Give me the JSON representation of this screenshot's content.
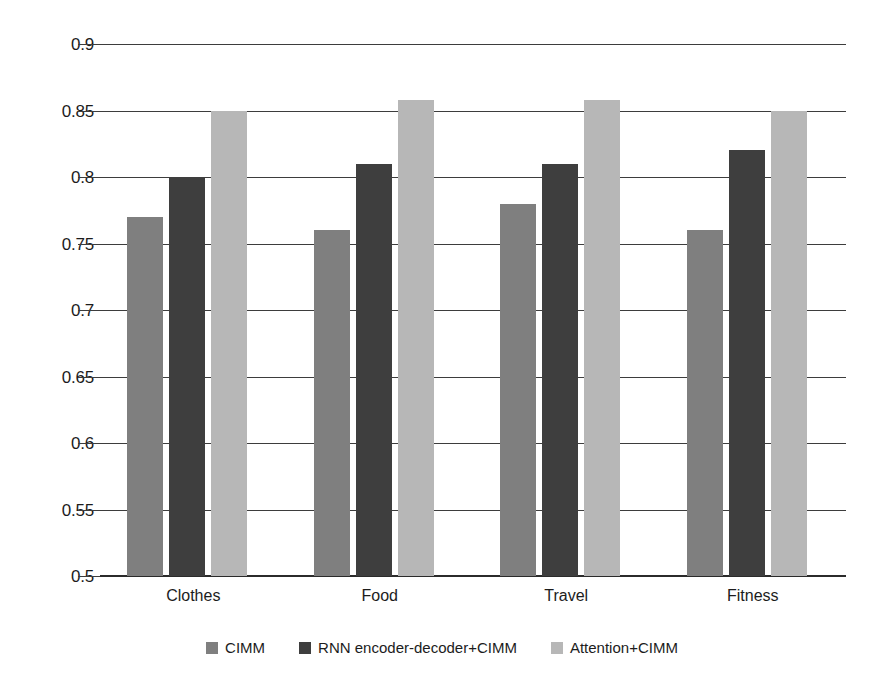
{
  "chart_data": {
    "type": "bar",
    "title": "",
    "subtitle": "",
    "xlabel": "",
    "ylabel": "",
    "categories": [
      "Clothes",
      "Food",
      "Travel",
      "Fitness"
    ],
    "series": [
      {
        "name": "CIMM",
        "color": "#7f7f7f",
        "values": [
          0.77,
          0.76,
          0.78,
          0.76
        ]
      },
      {
        "name": "RNN encoder-decoder+CIMM",
        "color": "#3e3e3e",
        "values": [
          0.8,
          0.81,
          0.81,
          0.82
        ]
      },
      {
        "name": "Attention+CIMM",
        "color": "#b7b7b7",
        "values": [
          0.85,
          0.858,
          0.858,
          0.85
        ]
      }
    ],
    "ylim": [
      0.5,
      0.9
    ],
    "ytick_labels": [
      "0.9",
      "0.85",
      "0.8",
      "0.75",
      "0.7",
      "0.65",
      "0.6",
      "0.55",
      "0.5"
    ],
    "ytick_values": [
      0.9,
      0.85,
      0.8,
      0.75,
      0.7,
      0.65,
      0.6,
      0.55,
      0.5
    ],
    "grid": true,
    "grid_color": "#3d3d3d",
    "legend_position": "bottom",
    "background": "#ffffff"
  }
}
